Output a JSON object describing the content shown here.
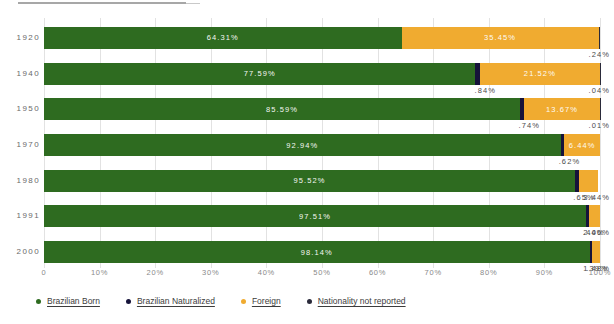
{
  "chart_data": {
    "type": "bar",
    "orientation": "horizontal",
    "stacked": true,
    "title": "",
    "xlabel": "",
    "ylabel": "",
    "xlim": [
      0,
      100
    ],
    "grid": true,
    "legend_position": "bottom",
    "categories": [
      "1920",
      "1940",
      "1950",
      "1970",
      "1980",
      "1991",
      "2000"
    ],
    "xticks": [
      "0",
      "10%",
      "20%",
      "30%",
      "40%",
      "50%",
      "60%",
      "70%",
      "80%",
      "90%",
      "100%"
    ],
    "xtick_values": [
      0,
      10,
      20,
      30,
      40,
      50,
      60,
      70,
      80,
      90,
      100
    ],
    "series": [
      {
        "name": "Brazilian Born",
        "color": "#2e6b20",
        "values": [
          64.31,
          77.59,
          85.59,
          92.94,
          95.52,
          97.51,
          98.14
        ],
        "labels": [
          "64.31%",
          "77.59%",
          "85.59%",
          "92.94%",
          "95.52%",
          "97.51%",
          "98.14%"
        ]
      },
      {
        "name": "Brazilian Naturalized",
        "color": "#16133a",
        "values": [
          0.0,
          0.84,
          0.74,
          0.62,
          0.65,
          0.44,
          0.39
        ],
        "labels": [
          "",
          ".84%",
          ".74%",
          ".62%",
          ".65%",
          ".44%",
          ".39%"
        ]
      },
      {
        "name": "Foreign",
        "color": "#f0ab30",
        "values": [
          35.45,
          21.52,
          13.67,
          6.44,
          3.44,
          2.06,
          1.48
        ],
        "labels": [
          "35.45%",
          "21.52%",
          "13.67%",
          "6.44%",
          "3.44%",
          "2.06%",
          "1.48%"
        ]
      },
      {
        "name": "Nationality not reported",
        "color": "#2a2a3a",
        "values": [
          0.24,
          0.04,
          0.01,
          0.0,
          0.0,
          0.0,
          0.0
        ],
        "labels": [
          ".24%",
          ".04%",
          ".01%",
          "",
          "",
          "",
          ""
        ]
      }
    ]
  },
  "legend": {
    "items": [
      {
        "label": "Brazilian Born",
        "color": "#2e6b20"
      },
      {
        "label": "Brazilian Naturalized",
        "color": "#16133a"
      },
      {
        "label": "Foreign",
        "color": "#f0ab30"
      },
      {
        "label": "Nationality not reported",
        "color": "#2a2a3a"
      }
    ]
  }
}
